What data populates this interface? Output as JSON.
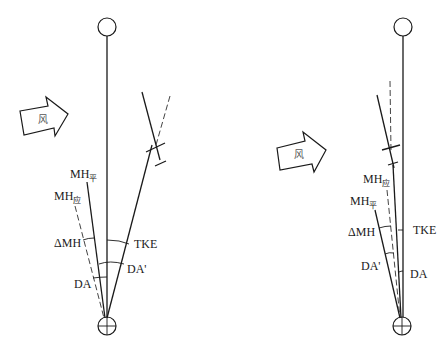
{
  "figure": {
    "colors": {
      "line": "#1a1a1a",
      "dashed": "#444444",
      "wind_text": "#555555",
      "background": "#ffffff"
    }
  },
  "left_diagram": {
    "wind_label": "风",
    "labels": {
      "mh_flat": "MH",
      "mh_flat_sub": "平",
      "mh_should": "MH",
      "mh_should_sub": "应",
      "delta_mh": "ΔMH",
      "da": "DA",
      "tke": "TKE",
      "da_prime": "DA'"
    }
  },
  "right_diagram": {
    "wind_label": "风",
    "labels": {
      "mh_should": "MH",
      "mh_should_sub": "应",
      "mh_flat": "MH",
      "mh_flat_sub": "平",
      "delta_mh": "ΔMH",
      "da_prime": "DA'",
      "tke": "TKE",
      "da": "DA"
    }
  }
}
